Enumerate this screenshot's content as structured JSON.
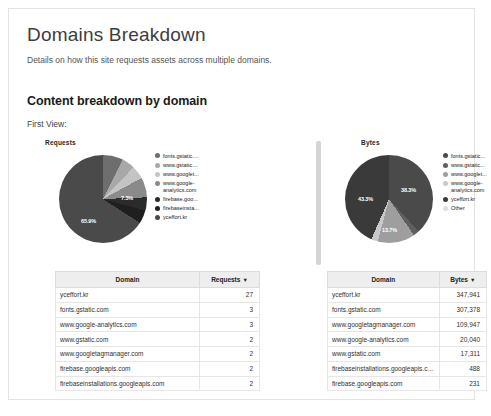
{
  "header": {
    "title": "Domains Breakdown",
    "subtitle": "Details on how this site requests assets across multiple domains."
  },
  "section": {
    "title": "Content breakdown by domain",
    "view_label": "First View:"
  },
  "colors": {
    "slice_1": "#4a4a4a",
    "slice_2": "#8f8f8f",
    "slice_3": "#bdbdbd",
    "slice_4": "#6e6e6e",
    "slice_5": "#2a2a2a",
    "slice_6": "#9c9c9c",
    "slice_7": "#555555",
    "other": "#d9d9d9",
    "header_bg": "#eeeeee",
    "divider": "#d4d4d4"
  },
  "chart_data": [
    {
      "type": "pie",
      "title": "Requests",
      "legend_position": "right",
      "categories": [
        "fonts.gstatic....",
        "www.gstatic....",
        "www.googlet...",
        "www.google-\nanalytics.com",
        "firebase.goo...",
        "firebaseinsta...",
        "yceffort.kr"
      ],
      "values": [
        3,
        2,
        2,
        3,
        2,
        2,
        27
      ],
      "percent_labels": [
        "65.9%",
        "7.3%"
      ],
      "slice_colors": [
        "#6e6e6e",
        "#a8a8a8",
        "#c4c4c4",
        "#8a8a8a",
        "#2b2b2b",
        "#1f1f1f",
        "#4a4a4a"
      ]
    },
    {
      "type": "pie",
      "title": "Bytes",
      "legend_position": "right",
      "categories": [
        "fonts.gstatic...",
        "www.gstatic...",
        "www.googlet...",
        "www.google-\nanalytics.com",
        "yceffort.kr",
        "Other"
      ],
      "values": [
        307378,
        17311,
        109947,
        20040,
        347941,
        719
      ],
      "percent_labels": [
        "38.3%",
        "43.3%",
        "13.7%"
      ],
      "slice_colors": [
        "#4a4a4a",
        "#5f5f5f",
        "#9e9e9e",
        "#c9c9c9",
        "#3a3a3a",
        "#e0e0e0"
      ]
    }
  ],
  "tables": [
    {
      "name": "requests-table",
      "columns": [
        "Domain",
        "Requests"
      ],
      "sort_column": "Requests",
      "sort_caret": "▼",
      "rows": [
        {
          "domain": "yceffort.kr",
          "value": "27"
        },
        {
          "domain": "fonts.gstatic.com",
          "value": "3"
        },
        {
          "domain": "www.google-analytics.com",
          "value": "3"
        },
        {
          "domain": "www.gstatic.com",
          "value": "2"
        },
        {
          "domain": "www.googletagmanager.com",
          "value": "2"
        },
        {
          "domain": "firebase.googleapis.com",
          "value": "2"
        },
        {
          "domain": "firebaseinstallations.googleapis.com",
          "value": "2"
        }
      ]
    },
    {
      "name": "bytes-table",
      "columns": [
        "Domain",
        "Bytes"
      ],
      "sort_column": "Bytes",
      "sort_caret": "▼",
      "rows": [
        {
          "domain": "yceffort.kr",
          "value": "347,941"
        },
        {
          "domain": "fonts.gstatic.com",
          "value": "307,378"
        },
        {
          "domain": "www.googletagmanager.com",
          "value": "109,947"
        },
        {
          "domain": "www.google-analytics.com",
          "value": "20,040"
        },
        {
          "domain": "www.gstatic.com",
          "value": "17,311"
        },
        {
          "domain": "firebaseinstallations.googleapis.com",
          "value": "488"
        },
        {
          "domain": "firebase.googleapis.com",
          "value": "231"
        }
      ]
    }
  ]
}
